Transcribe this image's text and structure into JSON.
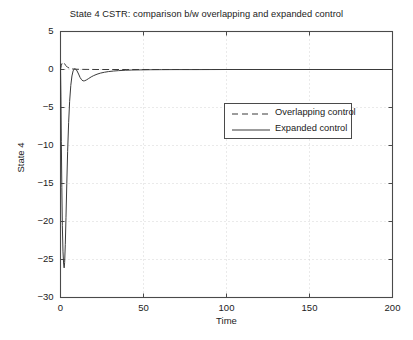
{
  "chart_data": {
    "type": "line",
    "title": "State 4 CSTR: comparison b/w overlapping and expanded control",
    "xlabel": "Time",
    "ylabel": "State 4",
    "xlim": [
      0,
      200
    ],
    "ylim": [
      -30,
      5
    ],
    "xticks": [
      0,
      50,
      100,
      150,
      200
    ],
    "yticks": [
      5,
      0,
      -5,
      -10,
      -15,
      -20,
      -25,
      -30
    ],
    "xtick_labels": [
      "0",
      "50",
      "100",
      "150",
      "200"
    ],
    "ytick_labels": [
      "5",
      "0",
      "-5",
      "-10",
      "-15",
      "-20",
      "-25",
      "-30"
    ],
    "grid": true,
    "grid_style": "dotted",
    "legend_position": "center-right-upper",
    "series": [
      {
        "name": "Overlapping control",
        "style": "dashed",
        "color": "#3a3a3a",
        "points": [
          [
            0,
            0.0
          ],
          [
            0.5,
            0.55
          ],
          [
            1,
            0.85
          ],
          [
            1.6,
            0.95
          ],
          [
            2.4,
            0.78
          ],
          [
            3.2,
            0.52
          ],
          [
            4.2,
            0.3
          ],
          [
            5.5,
            0.16
          ],
          [
            7,
            0.08
          ],
          [
            9,
            0.04
          ],
          [
            12,
            0.02
          ],
          [
            16,
            0.01
          ],
          [
            22,
            0.0
          ],
          [
            30,
            0.0
          ],
          [
            40,
            0.0
          ],
          [
            60,
            0.0
          ],
          [
            90,
            0.0
          ],
          [
            120,
            0.0
          ],
          [
            160,
            0.0
          ],
          [
            200,
            0.0
          ]
        ]
      },
      {
        "name": "Expanded control",
        "style": "solid",
        "color": "#3a3a3a",
        "points": [
          [
            0,
            0.6
          ],
          [
            0.25,
            -3.5
          ],
          [
            0.5,
            -9.5
          ],
          [
            0.8,
            -15.5
          ],
          [
            1.1,
            -20.5
          ],
          [
            1.5,
            -24.0
          ],
          [
            1.9,
            -25.6
          ],
          [
            2.2,
            -26.1
          ],
          [
            2.5,
            -25.4
          ],
          [
            2.9,
            -23.0
          ],
          [
            3.3,
            -19.5
          ],
          [
            3.8,
            -15.0
          ],
          [
            4.3,
            -10.8
          ],
          [
            4.9,
            -7.0
          ],
          [
            5.5,
            -4.2
          ],
          [
            6.2,
            -2.1
          ],
          [
            6.9,
            -0.85
          ],
          [
            7.6,
            -0.18
          ],
          [
            8.4,
            0.1
          ],
          [
            9.2,
            0.05
          ],
          [
            10,
            -0.2
          ],
          [
            10.9,
            -0.6
          ],
          [
            11.8,
            -1.05
          ],
          [
            12.7,
            -1.35
          ],
          [
            13.6,
            -1.5
          ],
          [
            14.6,
            -1.48
          ],
          [
            15.8,
            -1.35
          ],
          [
            17,
            -1.18
          ],
          [
            18.5,
            -0.97
          ],
          [
            20,
            -0.8
          ],
          [
            22,
            -0.62
          ],
          [
            24,
            -0.48
          ],
          [
            26.5,
            -0.36
          ],
          [
            29,
            -0.27
          ],
          [
            32,
            -0.2
          ],
          [
            35,
            -0.15
          ],
          [
            39,
            -0.1
          ],
          [
            43,
            -0.07
          ],
          [
            48,
            -0.05
          ],
          [
            54,
            -0.03
          ],
          [
            61,
            -0.02
          ],
          [
            70,
            -0.01
          ],
          [
            82,
            -0.01
          ],
          [
            100,
            0.0
          ],
          [
            125,
            0.0
          ],
          [
            155,
            0.0
          ],
          [
            200,
            0.0
          ]
        ]
      }
    ]
  },
  "legend": {
    "entries": [
      {
        "label": "Overlapping control",
        "style": "dashed"
      },
      {
        "label": "Expanded control",
        "style": "solid"
      }
    ]
  },
  "colors": {
    "axis": "#4a4a4a",
    "grid": "#c9c9c9",
    "line": "#3a3a3a",
    "background": "#ffffff",
    "text": "#222222"
  }
}
